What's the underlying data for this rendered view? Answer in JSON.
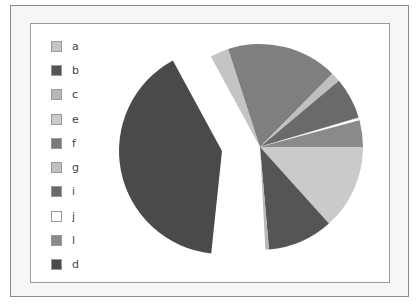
{
  "chart_data": {
    "type": "pie",
    "title": "",
    "legend_position": "left",
    "categories": [
      "a",
      "b",
      "c",
      "e",
      "f",
      "g",
      "i",
      "j",
      "l",
      "d"
    ],
    "values": [
      2.9,
      10.3,
      0.6,
      13.3,
      17.4,
      1.5,
      6.5,
      0.4,
      4.2,
      42.9
    ],
    "colors": [
      "#c4c4c4",
      "#555555",
      "#b8b8b8",
      "#cacaca",
      "#7f7f7f",
      "#c0c0c0",
      "#6a6a6a",
      "#ffffff",
      "#8a8a8a",
      "#4a4a4a"
    ],
    "exploded": [
      "d"
    ],
    "units": "percent (estimated)"
  },
  "legend": {
    "items": [
      {
        "label": "a",
        "color": "#c4c4c4"
      },
      {
        "label": "b",
        "color": "#555555"
      },
      {
        "label": "c",
        "color": "#b8b8b8"
      },
      {
        "label": "e",
        "color": "#cacaca"
      },
      {
        "label": "f",
        "color": "#7a7a7a"
      },
      {
        "label": "g",
        "color": "#c0c0c0"
      },
      {
        "label": "i",
        "color": "#6a6a6a"
      },
      {
        "label": "j",
        "color": "#ffffff"
      },
      {
        "label": "l",
        "color": "#8a8a8a"
      },
      {
        "label": "d",
        "color": "#4a4a4a"
      }
    ]
  },
  "pie_layout": {
    "cx": 260,
    "cy": 147,
    "r": 103,
    "slices": [
      {
        "label": "a",
        "start": 241.5,
        "end": 252,
        "color": "#c4c4c4"
      },
      {
        "label": "f",
        "start": 252,
        "end": 314.6,
        "color": "#7f7f7f"
      },
      {
        "label": "g",
        "start": 314.6,
        "end": 320,
        "color": "#c0c0c0"
      },
      {
        "label": "i",
        "start": 320,
        "end": 343.5,
        "color": "#6a6a6a"
      },
      {
        "label": "j",
        "start": 343.5,
        "end": 345,
        "color": "#ffffff"
      },
      {
        "label": "l",
        "start": 345,
        "end": 360,
        "color": "#8a8a8a"
      },
      {
        "label": "e",
        "start": 0,
        "end": 48,
        "color": "#cacaca"
      },
      {
        "label": "b",
        "start": 48,
        "end": 85,
        "color": "#555555"
      },
      {
        "label": "c",
        "start": 85,
        "end": 87,
        "color": "#b8b8b8"
      },
      {
        "label": "d",
        "start": 96,
        "end": 241.5,
        "color": "#4a4a4a",
        "offset_x": -38,
        "offset_y": 4
      }
    ]
  }
}
